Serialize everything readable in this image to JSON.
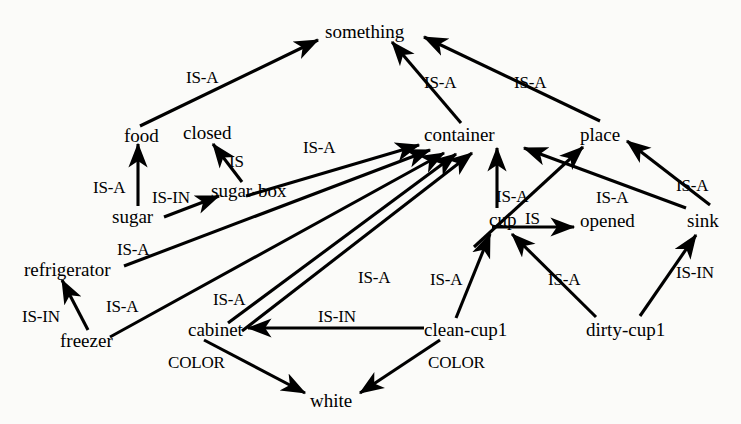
{
  "diagram": {
    "type": "semantic network / IS-A hierarchy graph",
    "background_color": "#fbfbf9",
    "ink_color": "#000000",
    "nodes": [
      {
        "id": "something",
        "label": "something",
        "x": 325,
        "y": 22
      },
      {
        "id": "food",
        "label": "food",
        "x": 124,
        "y": 126
      },
      {
        "id": "closed",
        "label": "closed",
        "x": 183,
        "y": 123
      },
      {
        "id": "container",
        "label": "container",
        "x": 424,
        "y": 125
      },
      {
        "id": "place",
        "label": "place",
        "x": 580,
        "y": 125
      },
      {
        "id": "sugar-box",
        "label": "sugar-box",
        "x": 211,
        "y": 181
      },
      {
        "id": "sugar",
        "label": "sugar",
        "x": 112,
        "y": 207
      },
      {
        "id": "cup",
        "label": "cup",
        "x": 489,
        "y": 210
      },
      {
        "id": "opened",
        "label": "opened",
        "x": 580,
        "y": 211
      },
      {
        "id": "sink",
        "label": "sink",
        "x": 687,
        "y": 211
      },
      {
        "id": "refrigerator",
        "label": "refrigerator",
        "x": 24,
        "y": 260
      },
      {
        "id": "freezer",
        "label": "freezer",
        "x": 60,
        "y": 331
      },
      {
        "id": "cabinet",
        "label": "cabinet",
        "x": 188,
        "y": 320
      },
      {
        "id": "clean-cup1",
        "label": "clean-cup1",
        "x": 424,
        "y": 320
      },
      {
        "id": "dirty-cup1",
        "label": "dirty-cup1",
        "x": 586,
        "y": 320
      },
      {
        "id": "white",
        "label": "white",
        "x": 310,
        "y": 391
      }
    ],
    "edges": [
      {
        "from": "food",
        "to": "something",
        "relation": "IS-A",
        "label_x": 186,
        "label_y": 69
      },
      {
        "from": "container",
        "to": "something",
        "relation": "IS-A",
        "label_x": 424,
        "label_y": 74
      },
      {
        "from": "place",
        "to": "something",
        "relation": "IS-A",
        "label_x": 514,
        "label_y": 74
      },
      {
        "from": "sugar",
        "to": "food",
        "relation": "IS-A",
        "label_x": 93,
        "label_y": 179
      },
      {
        "from": "sugar-box",
        "to": "closed",
        "relation": "IS",
        "label_x": 229,
        "label_y": 153
      },
      {
        "from": "sugar",
        "to": "sugar-box",
        "relation": "IS-IN",
        "label_x": 152,
        "label_y": 189
      },
      {
        "from": "sugar-box",
        "to": "container",
        "relation": "IS-A",
        "label_x": 303,
        "label_y": 139
      },
      {
        "from": "refrigerator",
        "to": "container",
        "relation": "IS-A",
        "label_x": 117,
        "label_y": 241
      },
      {
        "from": "freezer",
        "to": "refrigerator",
        "relation": "IS-IN",
        "label_x": 22,
        "label_y": 308
      },
      {
        "from": "freezer",
        "to": "container",
        "relation": "IS-A",
        "label_x": 106,
        "label_y": 298
      },
      {
        "from": "cabinet",
        "to": "container",
        "relation": "IS-A",
        "label_x": 213,
        "label_y": 291
      },
      {
        "from": "clean-cup1",
        "to": "container",
        "relation": "IS-A",
        "label_x": 358,
        "label_y": 269
      },
      {
        "from": "cup",
        "to": "container",
        "relation": "IS-A",
        "label_x": 496,
        "label_y": 188
      },
      {
        "from": "cup",
        "to": "opened",
        "relation": "IS",
        "label_x": 525,
        "label_y": 210
      },
      {
        "from": "sink",
        "to": "container",
        "relation": "IS-A",
        "label_x": 596,
        "label_y": 189
      },
      {
        "from": "sink",
        "to": "place",
        "relation": "IS-A",
        "label_x": 676,
        "label_y": 177
      },
      {
        "from": "clean-cup1",
        "to": "cup",
        "relation": "IS-A",
        "label_x": 430,
        "label_y": 271
      },
      {
        "from": "dirty-cup1",
        "to": "cup",
        "relation": "IS-A",
        "label_x": 548,
        "label_y": 271
      },
      {
        "from": "dirty-cup1",
        "to": "sink",
        "relation": "IS-IN",
        "label_x": 676,
        "label_y": 264
      },
      {
        "from": "clean-cup1",
        "to": "cabinet",
        "relation": "IS-IN",
        "label_x": 318,
        "label_y": 308
      },
      {
        "from": "cabinet",
        "to": "white",
        "relation": "COLOR",
        "label_x": 168,
        "label_y": 354
      },
      {
        "from": "clean-cup1",
        "to": "white",
        "relation": "COLOR",
        "label_x": 428,
        "label_y": 354
      }
    ]
  }
}
